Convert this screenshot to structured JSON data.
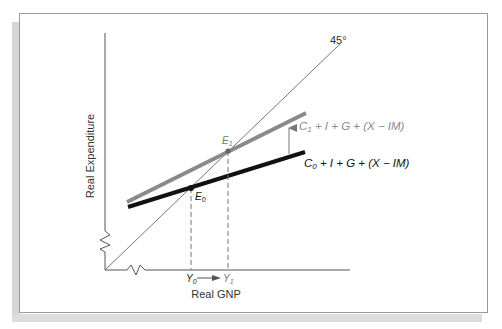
{
  "diagram": {
    "type": "keynesian-cross",
    "axes": {
      "x_label": "Real GNP",
      "y_label": "Real Expenditure"
    },
    "reference_line": {
      "label": "45°"
    },
    "curves": [
      {
        "id": "C1",
        "label_main": "C",
        "label_sub": "1",
        "label_rest": " + I + G + (X − IM)",
        "color": "#8a8a8a"
      },
      {
        "id": "C0",
        "label_main": "C",
        "label_sub": "0",
        "label_rest": " + I + G + (X − IM)",
        "color": "#111111"
      }
    ],
    "equilibria": [
      {
        "id": "E0",
        "label_main": "E",
        "label_sub": "0"
      },
      {
        "id": "E1",
        "label_main": "E",
        "label_sub": "1"
      }
    ],
    "x_marks": [
      {
        "id": "Y0",
        "label_main": "Y",
        "label_sub": "0"
      },
      {
        "id": "Y1",
        "label_main": "Y",
        "label_sub": "1"
      }
    ],
    "shift_direction": "up"
  }
}
